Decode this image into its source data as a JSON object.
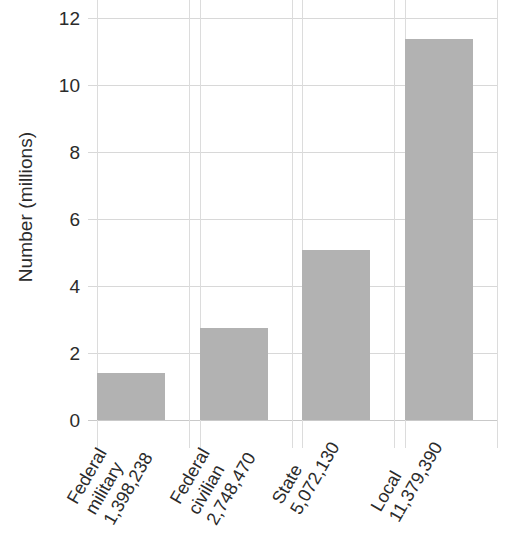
{
  "chart_data": {
    "type": "bar",
    "title": "",
    "subtitle": "",
    "xlabel": "",
    "ylabel": "Number (millions)",
    "categories": [
      "Federal military",
      "Federal civilian",
      "State",
      "Local"
    ],
    "category_lines": [
      [
        "Federal",
        "military",
        "1,398,238"
      ],
      [
        "Federal",
        "civilian",
        "2,748,470"
      ],
      [
        "State",
        "5,072,130"
      ],
      [
        "Local",
        "11,379,390"
      ]
    ],
    "data_labels": [
      "1,398,238",
      "2,748,470",
      "5,072,130",
      "11,379,390"
    ],
    "values": [
      1.398238,
      2.74847,
      5.07213,
      11.37939
    ],
    "raw_values": [
      1398238,
      2748470,
      5072130,
      11379390
    ],
    "ylim": [
      0,
      12
    ],
    "yticks": [
      0,
      2,
      4,
      6,
      8,
      10,
      12
    ],
    "ytick_labels": [
      "0",
      "2",
      "4",
      "6",
      "8",
      "10",
      "12"
    ],
    "grid": true,
    "grid_axis": "both",
    "legend": false,
    "legend_position": "none",
    "bar_color": "#b2b2b2",
    "grid_color": "#d8d8d8",
    "text_color": "#2b2b2b",
    "background_color": "#ffffff",
    "xtick_label_rotation": -60
  }
}
